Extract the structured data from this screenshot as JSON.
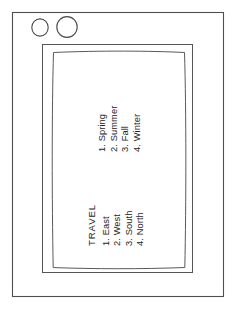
{
  "device": {
    "name": "tablet-sketch",
    "stroke_color": "#4a4a4a",
    "background_color": "#ffffff",
    "text_color": "#242424"
  },
  "hardware": {
    "camera_label": "camera",
    "speaker_label": "speaker"
  },
  "screen": {
    "seasons_list": {
      "items": [
        "1. Spring",
        "2. Summer",
        "3. Fall",
        "4. Winter"
      ]
    },
    "travel_list": {
      "heading": "TRAVEL",
      "items": [
        "1. East",
        "2. West",
        "3. South",
        "4. North"
      ]
    }
  }
}
